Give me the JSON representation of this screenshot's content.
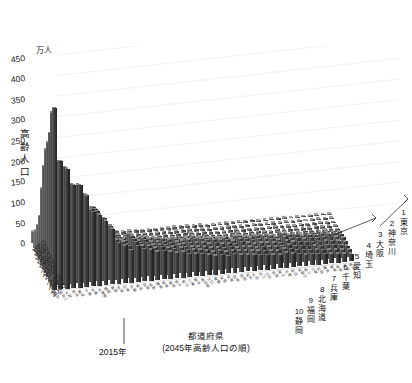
{
  "chart_data": {
    "type": "bar",
    "title": "",
    "subtitle": "",
    "unit_label": "万人",
    "ylabel": "高齢人口",
    "ylabel_chars": [
      "高",
      "齢",
      "人",
      "口"
    ],
    "xlabel": "都道府県",
    "xlabel_note": "(2045年高齢人口の順)",
    "zlabel": "",
    "ylim": [
      0,
      475
    ],
    "yticks": [
      0,
      50,
      100,
      150,
      200,
      250,
      300,
      350,
      400,
      450
    ],
    "grid": true,
    "legend": "none",
    "projection": "3d-bar",
    "depth_axis_name": "年",
    "depth_categories": [
      "1950",
      "1955",
      "1960",
      "1965",
      "1970",
      "1975",
      "1980",
      "1985",
      "1990",
      "1995",
      "2000",
      "2005",
      "2010",
      "2015",
      "2020",
      "2025",
      "2030",
      "2035",
      "2040",
      "2045"
    ],
    "depth_tick_labels": [
      "1950",
      "1960",
      "1970",
      "1980",
      "1990",
      "2000",
      "2010",
      "2020",
      "2030",
      "2040"
    ],
    "annotation_2015": "2015年",
    "categories": [
      "東京",
      "神奈川",
      "大阪",
      "埼玉",
      "愛知",
      "千葉",
      "兵庫",
      "北海道",
      "福岡",
      "静岡",
      "茨城",
      "広島",
      "京都",
      "新潟",
      "宮城",
      "長野",
      "福島",
      "岐阜",
      "群馬",
      "栃木",
      "岡山",
      "三重",
      "熊本",
      "鹿児島",
      "山口",
      "愛媛",
      "長崎",
      "青森",
      "奈良",
      "滋賀",
      "岩手",
      "大分",
      "石川",
      "山形",
      "宮崎",
      "富山",
      "沖縄",
      "秋田",
      "和歌山",
      "香川",
      "山梨",
      "佐賀",
      "福井",
      "徳島",
      "島根",
      "高知",
      "鳥取"
    ],
    "ranked_top10": [
      {
        "rank": "1",
        "name": "東京"
      },
      {
        "rank": "2",
        "name": "神奈川"
      },
      {
        "rank": "3",
        "name": "大阪"
      },
      {
        "rank": "4",
        "name": "埼玉"
      },
      {
        "rank": "5",
        "name": "愛知"
      },
      {
        "rank": "6",
        "name": "千葉"
      },
      {
        "rank": "7",
        "name": "兵庫"
      },
      {
        "rank": "8",
        "name": "北海道"
      },
      {
        "rank": "9",
        "name": "福岡"
      },
      {
        "rank": "10",
        "name": "静岡"
      }
    ],
    "series": [
      {
        "name": "1950",
        "values": [
          28,
          18,
          17,
          10,
          14,
          10,
          13,
          10,
          13,
          10,
          8,
          9,
          8,
          10,
          8,
          8,
          8,
          7,
          7,
          6,
          7,
          6,
          7,
          7,
          7,
          6,
          6,
          4,
          4,
          4,
          5,
          5,
          4,
          4,
          5,
          3,
          3,
          4,
          4,
          4,
          3,
          3,
          3,
          3,
          3,
          3,
          2
        ]
      },
      {
        "name": "1960",
        "values": [
          38,
          23,
          23,
          12,
          17,
          12,
          16,
          14,
          16,
          12,
          10,
          11,
          9,
          12,
          9,
          10,
          9,
          9,
          8,
          8,
          9,
          7,
          8,
          9,
          8,
          7,
          7,
          5,
          5,
          5,
          6,
          6,
          5,
          5,
          5,
          4,
          4,
          5,
          4,
          4,
          4,
          4,
          3,
          4,
          4,
          4,
          3
        ]
      },
      {
        "name": "1970",
        "values": [
          52,
          31,
          31,
          17,
          22,
          17,
          20,
          19,
          19,
          15,
          12,
          14,
          11,
          14,
          11,
          12,
          11,
          11,
          10,
          10,
          11,
          9,
          10,
          11,
          10,
          9,
          9,
          7,
          6,
          6,
          8,
          7,
          6,
          6,
          6,
          5,
          5,
          6,
          5,
          5,
          4,
          5,
          4,
          5,
          5,
          4,
          3
        ]
      },
      {
        "name": "1980",
        "values": [
          75,
          45,
          45,
          27,
          31,
          28,
          28,
          27,
          25,
          22,
          17,
          19,
          15,
          19,
          15,
          16,
          15,
          15,
          14,
          13,
          14,
          12,
          13,
          14,
          13,
          11,
          12,
          10,
          9,
          9,
          11,
          10,
          8,
          9,
          9,
          7,
          6,
          9,
          7,
          7,
          6,
          7,
          6,
          7,
          6,
          6,
          5
        ]
      },
      {
        "name": "1990",
        "values": [
          107,
          66,
          68,
          44,
          45,
          45,
          41,
          41,
          36,
          33,
          26,
          27,
          22,
          27,
          22,
          22,
          22,
          21,
          20,
          19,
          19,
          17,
          17,
          19,
          18,
          16,
          16,
          15,
          14,
          13,
          15,
          14,
          12,
          13,
          12,
          11,
          9,
          13,
          10,
          10,
          9,
          9,
          8,
          9,
          9,
          8,
          7
        ]
      },
      {
        "name": "2000",
        "values": [
          184,
          116,
          122,
          81,
          79,
          80,
          72,
          71,
          62,
          58,
          46,
          45,
          38,
          47,
          38,
          38,
          38,
          35,
          34,
          32,
          32,
          28,
          29,
          30,
          29,
          26,
          26,
          25,
          23,
          21,
          25,
          23,
          20,
          21,
          20,
          19,
          16,
          21,
          17,
          16,
          15,
          15,
          13,
          15,
          14,
          13,
          11
        ]
      },
      {
        "name": "2010",
        "values": [
          249,
          163,
          178,
          124,
          127,
          119,
          110,
          115,
          96,
          87,
          66,
          65,
          55,
          65,
          54,
          55,
          52,
          50,
          48,
          45,
          46,
          41,
          43,
          43,
          40,
          37,
          37,
          35,
          34,
          30,
          35,
          32,
          28,
          30,
          28,
          27,
          23,
          29,
          25,
          23,
          21,
          21,
          19,
          21,
          19,
          19,
          15
        ]
      },
      {
        "name": "2015",
        "values": [
          300,
          207,
          225,
          170,
          166,
          154,
          141,
          148,
          117,
          107,
          79,
          76,
          66,
          76,
          63,
          64,
          60,
          58,
          55,
          52,
          54,
          47,
          48,
          48,
          46,
          42,
          42,
          40,
          38,
          35,
          38,
          36,
          32,
          33,
          32,
          30,
          27,
          33,
          28,
          26,
          24,
          23,
          22,
          23,
          21,
          21,
          17
        ]
      },
      {
        "name": "2020",
        "values": [
          326,
          233,
          243,
          191,
          185,
          170,
          152,
          160,
          126,
          115,
          85,
          81,
          70,
          81,
          68,
          68,
          63,
          61,
          58,
          55,
          57,
          50,
          50,
          50,
          48,
          44,
          44,
          41,
          40,
          37,
          40,
          37,
          34,
          34,
          33,
          31,
          29,
          34,
          29,
          27,
          25,
          24,
          23,
          24,
          22,
          21,
          18
        ]
      },
      {
        "name": "2030",
        "values": [
          360,
          260,
          262,
          213,
          208,
          189,
          162,
          165,
          136,
          122,
          90,
          85,
          73,
          84,
          72,
          71,
          65,
          64,
          61,
          57,
          59,
          52,
          52,
          51,
          49,
          45,
          44,
          41,
          42,
          39,
          40,
          38,
          35,
          34,
          34,
          32,
          32,
          34,
          29,
          27,
          26,
          25,
          23,
          24,
          22,
          21,
          18
        ]
      },
      {
        "name": "2040",
        "values": [
          420,
          300,
          285,
          242,
          240,
          215,
          176,
          171,
          152,
          132,
          97,
          91,
          78,
          87,
          77,
          75,
          69,
          68,
          65,
          61,
          62,
          55,
          55,
          53,
          50,
          46,
          46,
          42,
          44,
          42,
          41,
          39,
          37,
          35,
          35,
          33,
          36,
          34,
          30,
          28,
          27,
          26,
          24,
          24,
          22,
          21,
          19
        ]
      },
      {
        "name": "2045",
        "values": [
          441,
          311,
          291,
          250,
          249,
          222,
          180,
          172,
          156,
          135,
          99,
          92,
          79,
          87,
          78,
          76,
          70,
          69,
          66,
          62,
          63,
          56,
          55,
          53,
          50,
          46,
          46,
          42,
          45,
          43,
          41,
          39,
          37,
          35,
          35,
          33,
          37,
          33,
          30,
          28,
          27,
          26,
          24,
          24,
          22,
          21,
          19
        ]
      }
    ]
  },
  "axis": {
    "unit": "万人",
    "y_title_chars": [
      "高",
      "齢",
      "人",
      "口"
    ],
    "x_title_main": "都道府県",
    "x_title_sub": "(2045年高齢人口の順)",
    "callout_2015": "2015年"
  }
}
